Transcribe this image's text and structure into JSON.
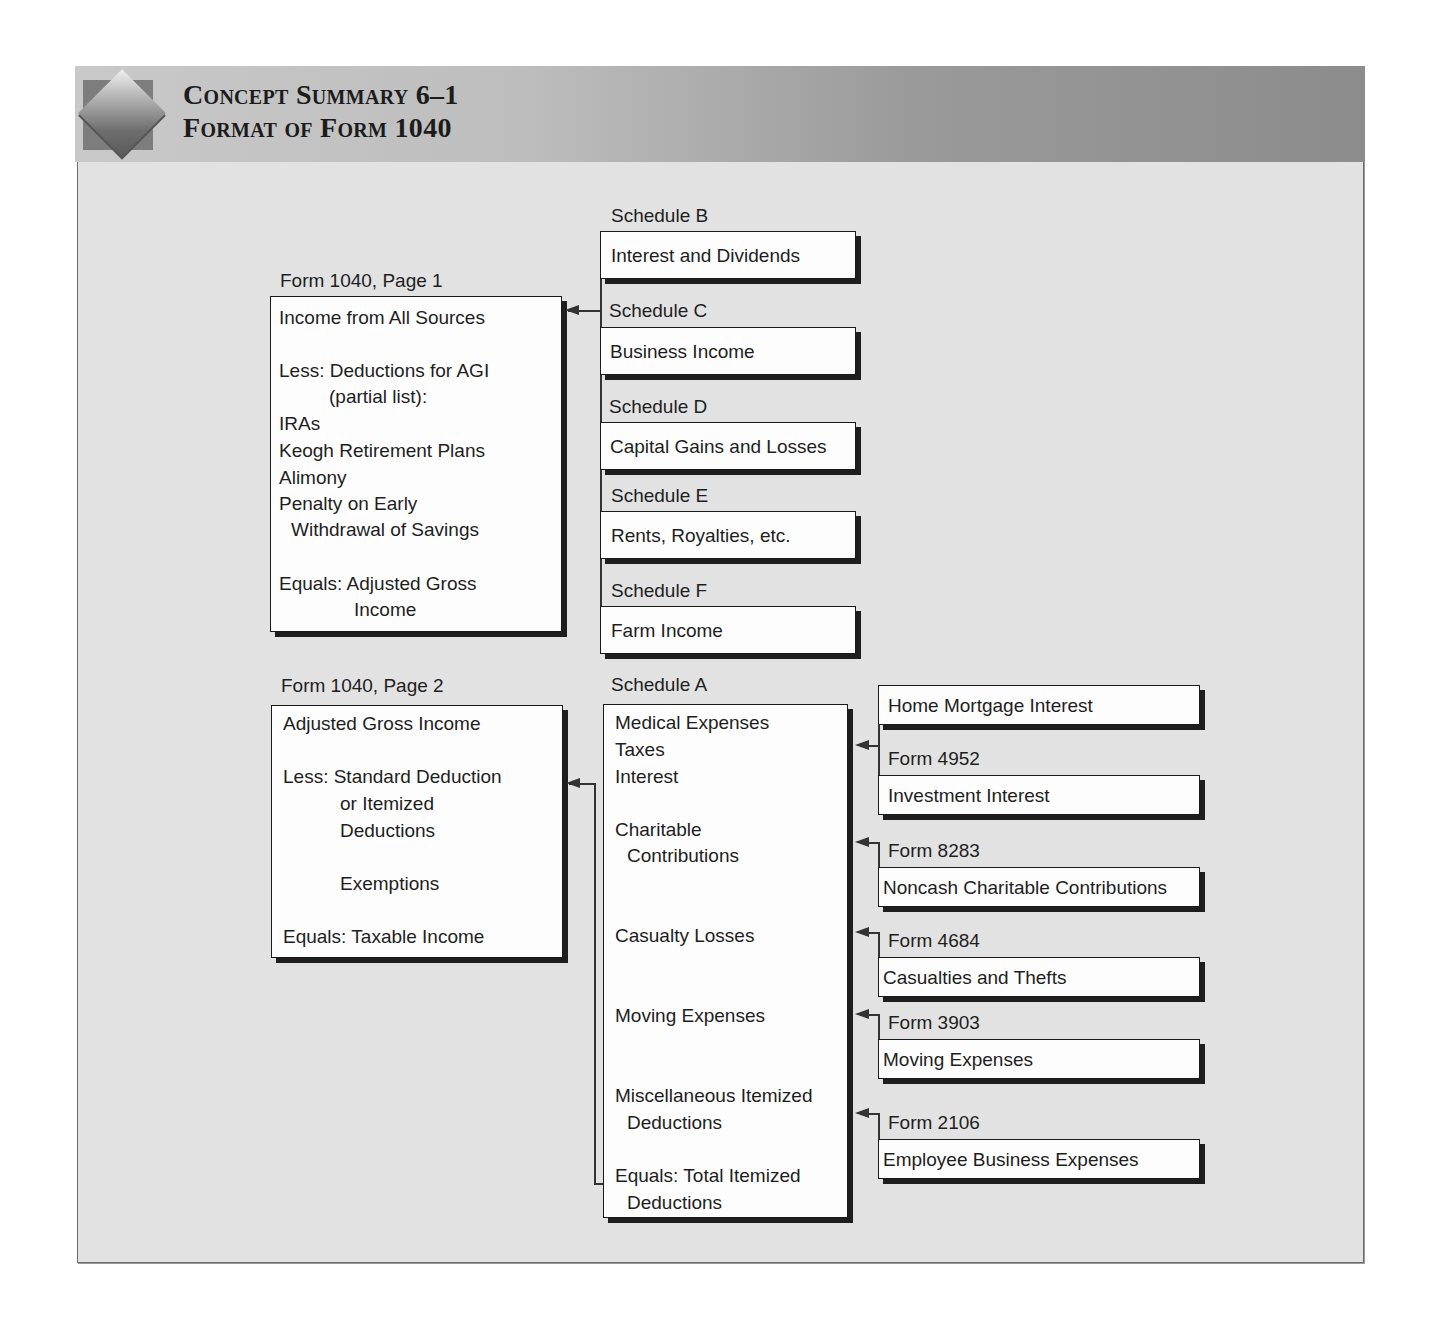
{
  "header": {
    "title_line1": "Concept Summary 6–1",
    "title_line2": "Format of Form 1040",
    "logo_icon": "diamond-logo-icon"
  },
  "page1": {
    "label": "Form 1040, Page 1",
    "lines": [
      "Income from All Sources",
      "Less: Deductions for AGI",
      "(partial list):",
      "IRAs",
      "Keogh Retirement Plans",
      "Alimony",
      "Penalty on Early",
      "Withdrawal of Savings",
      "Equals: Adjusted Gross",
      "Income"
    ]
  },
  "page2": {
    "label": "Form 1040, Page 2",
    "lines": [
      "Adjusted Gross Income",
      "Less: Standard Deduction",
      "or Itemized",
      "Deductions",
      "Exemptions",
      "Equals: Taxable Income"
    ]
  },
  "schedules_income": [
    {
      "label": "Schedule B",
      "content": "Interest and Dividends"
    },
    {
      "label": "Schedule C",
      "content": "Business Income"
    },
    {
      "label": "Schedule D",
      "content": "Capital Gains and Losses"
    },
    {
      "label": "Schedule E",
      "content": "Rents, Royalties, etc."
    },
    {
      "label": "Schedule F",
      "content": "Farm Income"
    }
  ],
  "schedule_a": {
    "label": "Schedule A",
    "lines": [
      "Medical Expenses",
      "Taxes",
      "Interest",
      "Charitable",
      "Contributions",
      "Casualty Losses",
      "Moving Expenses",
      "Miscellaneous Itemized",
      "Deductions",
      "Equals: Total Itemized",
      "Deductions"
    ]
  },
  "supporting_forms": [
    {
      "label": "",
      "content": "Home Mortgage Interest"
    },
    {
      "label": "Form 4952",
      "content": "Investment Interest"
    },
    {
      "label": "Form 8283",
      "content": "Noncash Charitable Contributions"
    },
    {
      "label": "Form 4684",
      "content": "Casualties and Thefts"
    },
    {
      "label": "Form 3903",
      "content": "Moving Expenses"
    },
    {
      "label": "Form 2106",
      "content": "Employee Business Expenses"
    }
  ],
  "colors": {
    "panel_bg": "#e2e2e2",
    "header_light": "#c9c9c9",
    "header_dark": "#8c8c8c",
    "box_bg": "#fdfdfd",
    "box_border": "#1a1a1a",
    "connector": "#333333"
  }
}
